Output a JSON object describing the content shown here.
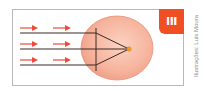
{
  "figure": {
    "panel_label": "III",
    "credit": "Ilustrações: Luis Moura",
    "colors": {
      "badge": "#f04e23",
      "arrows": "#ef4b3a",
      "rays": "#3a2a26",
      "eyeball_fill": "#f7b7a0",
      "eyeball_stroke": "#e8907a",
      "focal_point": "#f39c1f",
      "frame_border": "#b9b9b9"
    },
    "rays": {
      "count": 3,
      "y_positions": [
        33,
        49,
        65
      ],
      "arrow_rows": 3,
      "arrows_per_row": 2
    },
    "eye": {
      "center": [
        117,
        48
      ],
      "radii": [
        36,
        32
      ],
      "lens_x": 96,
      "focal_point": [
        129,
        49
      ]
    }
  }
}
